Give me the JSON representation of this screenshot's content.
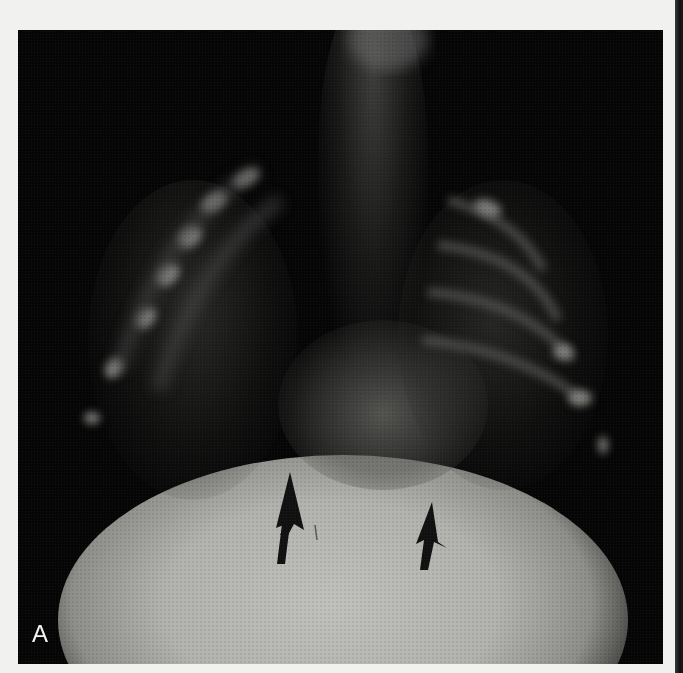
{
  "figure": {
    "panel_label": "A",
    "colors": {
      "page_background": "#f1f1ef",
      "image_background": "#060606",
      "abdomen_fill": "#b4b4b0",
      "rib_highlight": "#9a9a96",
      "arrow": "#111111",
      "label_text": "#f2f2f2"
    },
    "arrows": [
      {
        "name": "left-arrow",
        "tip_x": 290,
        "tip_y": 472,
        "direction": "up"
      },
      {
        "name": "right-arrow",
        "tip_x": 433,
        "tip_y": 502,
        "direction": "up"
      }
    ]
  }
}
